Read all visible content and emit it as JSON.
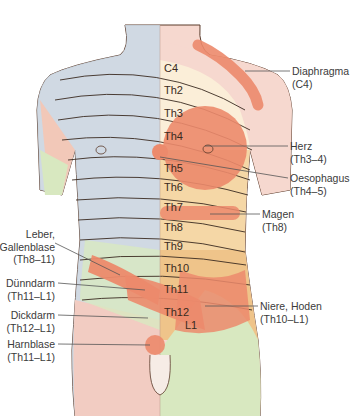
{
  "diagram": {
    "title": "",
    "segments": [
      "C4",
      "Th2",
      "Th3",
      "Th4",
      "Th5",
      "Th6",
      "Th7",
      "Th8",
      "Th9",
      "Th10",
      "Th11",
      "Th12",
      "L1"
    ],
    "labels_right": [
      {
        "name": "diaphragma",
        "line1": "Diaphragma",
        "line2": "(C4)"
      },
      {
        "name": "herz",
        "line1": "Herz",
        "line2": "(Th3–4)"
      },
      {
        "name": "oesophagus",
        "line1": "Oesophagus",
        "line2": "(Th4–5)"
      },
      {
        "name": "magen",
        "line1": "Magen",
        "line2": "(Th8)"
      },
      {
        "name": "niere-hoden",
        "line1": "Niere, Hoden",
        "line2": "(Th10–L1)"
      }
    ],
    "labels_left": [
      {
        "name": "leber-gallenblase",
        "line1": "Leber,",
        "line2": "Gallenblase",
        "line3": "(Th8–11)"
      },
      {
        "name": "duenndarm",
        "line1": "Dünndarm",
        "line2": "(Th11–L1)"
      },
      {
        "name": "dickdarm",
        "line1": "Dickdarm",
        "line2": "(Th12–L1)"
      },
      {
        "name": "harnblase",
        "line1": "Harnblase",
        "line2": "(Th11–L1)"
      }
    ],
    "colors": {
      "zone_red": "#ec8a6c",
      "band_light": "#fbeed8",
      "band_mid": "#f5d7a6",
      "band_orange": "#efc48a",
      "left_blue": "#c9d9e6",
      "left_green": "#d8e8c0",
      "skin_pink": "#f6d8cf"
    }
  }
}
